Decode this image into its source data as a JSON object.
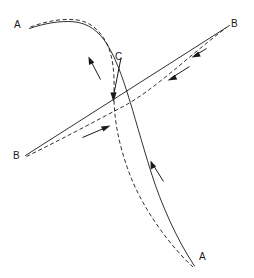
{
  "figure": {
    "type": "technical-line-diagram",
    "background_color": "#ffffff",
    "stroke_color": "#1a1a1a",
    "width": 254,
    "height": 278,
    "labels": [
      {
        "id": "a-top-left",
        "text": "A",
        "x": 14,
        "y": 20
      },
      {
        "id": "b-top-right",
        "text": "B",
        "x": 231,
        "y": 19
      },
      {
        "id": "c-center",
        "text": "C",
        "x": 115,
        "y": 52
      },
      {
        "id": "b-bottom-left",
        "text": "B",
        "x": 13,
        "y": 151
      },
      {
        "id": "a-bottom-right",
        "text": "A",
        "x": 199,
        "y": 252
      }
    ],
    "curves": [
      {
        "id": "curve-a-solid",
        "name": "trajectory-a-solid",
        "style": "solid",
        "endpoint_labels": [
          "A",
          "A"
        ],
        "path": "M 29.5,28.5 C 44,23.5 60,20.5 74,21.8 C 88,23.2 99,31 107.5,45 C 116,59 122,76 128,95 C 134,114 141,140 151,172 C 161,204 177,240 194.5,266"
      },
      {
        "id": "curve-a-dashed",
        "name": "trajectory-a-dashed",
        "style": "dashed",
        "endpoint_labels": [
          "A",
          "A"
        ],
        "path": "M 30.5,27.0 C 45,21.5 62,18.2 76,19.8 C 90,21.5 100,30 107,44 C 113,57 114.5,72 114,92 C 113.5,113 117,141 130,175 C 143,209 170,246 193,267"
      },
      {
        "id": "line-b-solid",
        "name": "trajectory-b-solid",
        "style": "solid",
        "endpoint_labels": [
          "B",
          "B"
        ],
        "path": "M 25.5,155.5 L 229.5,25.5"
      },
      {
        "id": "curve-b-dashed",
        "name": "trajectory-b-dashed",
        "style": "dashed",
        "endpoint_labels": [
          "B",
          "B"
        ],
        "path": "M 26.5,156.5 C 60,140 94,122 124,106 C 154,90 190,55 226.5,27.5"
      }
    ],
    "leader": {
      "id": "leader-c",
      "name": "c-leader-arrow",
      "from_x": 121,
      "from_y": 58,
      "to_x": 113.5,
      "to_y": 101,
      "label": "C"
    },
    "arrows": [
      {
        "id": "arrow-a-upper",
        "name": "direction-arrow-a-upper",
        "x1": 100.5,
        "y1": 79.5,
        "x2": 88.5,
        "y2": 56.5
      },
      {
        "id": "arrow-b-upper-solid",
        "name": "direction-arrow-b-upper-solid",
        "x1": 206.5,
        "y1": 48.5,
        "x2": 191.5,
        "y2": 57.5
      },
      {
        "id": "arrow-b-upper-dashed",
        "name": "direction-arrow-b-upper-dashed",
        "x1": 189.5,
        "y1": 66.5,
        "x2": 167.5,
        "y2": 80.5
      },
      {
        "id": "arrow-b-lower-dashed",
        "name": "direction-arrow-b-lower-dashed",
        "x1": 82.5,
        "y1": 137.5,
        "x2": 110.5,
        "y2": 125.5
      },
      {
        "id": "arrow-a-lower",
        "name": "direction-arrow-a-lower",
        "x1": 163.5,
        "y1": 181.5,
        "x2": 150.5,
        "y2": 160.5
      }
    ]
  }
}
